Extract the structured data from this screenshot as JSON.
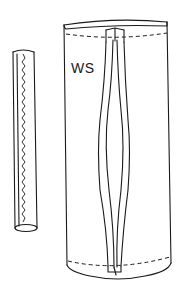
{
  "diagram": {
    "type": "sewing-construction-illustration",
    "elements": [
      {
        "name": "narrow-tube",
        "description": "Narrow stitched tube with zigzag seam"
      },
      {
        "name": "garment-panel",
        "description": "Panel shown wrong side with dart/seam and dashed stitch lines"
      }
    ],
    "labels": {
      "panel_side": "WS"
    },
    "colors": {
      "line": "#1a1a1a",
      "background": "#ffffff"
    }
  }
}
